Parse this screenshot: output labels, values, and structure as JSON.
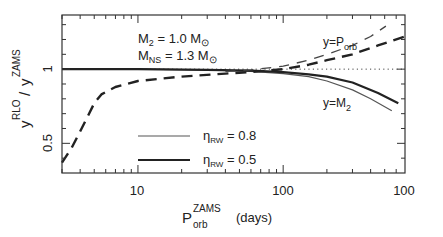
{
  "chart_data": {
    "type": "line",
    "title": "",
    "xlabel": {
      "main": "P",
      "sup": "ZAMS",
      "sub": "orb",
      "unit": "(days)"
    },
    "ylabel": {
      "main": "y",
      "sup": "RLO",
      "slash": "/",
      "main2": "y",
      "sup2": "ZAMS"
    },
    "xscale": "log",
    "xlim": [
      3,
      690
    ],
    "ylim": [
      0.3,
      1.365
    ],
    "x_tick_labels": [
      {
        "value": 10,
        "label": "10"
      },
      {
        "value": 100,
        "label": "100"
      },
      {
        "value": 690,
        "label": "100"
      }
    ],
    "y_tick_labels": [
      {
        "value": 1,
        "label": "1"
      },
      {
        "value": 0.5,
        "label": "0.5"
      }
    ],
    "reference_line": {
      "y": 1,
      "style": "dotted"
    },
    "annotations": {
      "params_line1": {
        "main": "M",
        "sub": "2",
        "rest": " = 1.0 M",
        "sym": "⊙"
      },
      "params_line2": {
        "main": "M",
        "sub": "NS",
        "rest": " = 1.3 M",
        "sym": "⊙"
      },
      "porb_label": {
        "main": "y=P",
        "sub": "orb"
      },
      "m2_label": {
        "main": "y=M",
        "sub": "2"
      }
    },
    "legend": {
      "position": "center-left",
      "entries": [
        {
          "symbol": "η",
          "sub": "RW",
          "text": " = 0.8",
          "style": "thin"
        },
        {
          "symbol": "η",
          "sub": "RW",
          "text": " = 0.5",
          "style": "thick"
        }
      ]
    },
    "series": [
      {
        "name": "y=M2, ηRW=0.8",
        "style": "thin-solid",
        "x": [
          3,
          10,
          30,
          60,
          100,
          150,
          200,
          300,
          400,
          560
        ],
        "y": [
          1.0,
          1.0,
          0.995,
          0.985,
          0.97,
          0.95,
          0.92,
          0.86,
          0.8,
          0.72
        ]
      },
      {
        "name": "y=M2, ηRW=0.5",
        "style": "thick-solid",
        "x": [
          3,
          10,
          30,
          60,
          100,
          150,
          200,
          300,
          450,
          620
        ],
        "y": [
          1.0,
          1.0,
          0.995,
          0.99,
          0.98,
          0.965,
          0.95,
          0.91,
          0.84,
          0.77
        ]
      },
      {
        "name": "y=Porb, ηRW=0.8",
        "style": "thin-dashed",
        "x": [
          40,
          60,
          100,
          150,
          200,
          300,
          400,
          510
        ],
        "y": [
          0.985,
          0.995,
          1.02,
          1.06,
          1.1,
          1.16,
          1.22,
          1.29
        ]
      },
      {
        "name": "y=Porb, ηRW=0.5",
        "style": "thick-dashed",
        "x": [
          3,
          3.5,
          4,
          4.5,
          5,
          5.6,
          7,
          10,
          20,
          40,
          60,
          100,
          150,
          200,
          300,
          450,
          690
        ],
        "y": [
          0.37,
          0.47,
          0.58,
          0.68,
          0.77,
          0.83,
          0.88,
          0.92,
          0.95,
          0.97,
          0.98,
          1.0,
          1.03,
          1.06,
          1.1,
          1.16,
          1.22
        ]
      }
    ]
  }
}
